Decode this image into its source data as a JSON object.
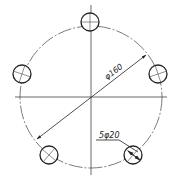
{
  "drawing": {
    "type": "bolt hole circle technical drawing",
    "pitch_circle_label": "φ160",
    "holes_label": "5φ20",
    "hole_count": 5,
    "colors": {
      "line": "#222222",
      "background": "#ffffff"
    }
  }
}
